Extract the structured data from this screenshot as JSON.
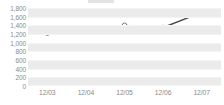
{
  "chart_data": {
    "type": "line",
    "title": "",
    "subtitle": "",
    "xlabel": "",
    "ylabel": "",
    "categories": [
      "12/03",
      "12/04",
      "12/05",
      "12/06",
      "12/07"
    ],
    "series": [
      {
        "name": "series-1",
        "values": [
          1220,
          1250,
          1400,
          1350,
          1700
        ]
      }
    ],
    "ylim": [
      0,
      1800
    ],
    "ytick_step": 200,
    "ytick_labels": [
      "1,800",
      "1,600",
      "1,400",
      "1,200",
      "1,000",
      "800",
      "600",
      "400",
      "200",
      "0"
    ],
    "ytick_values": [
      1800,
      1600,
      1400,
      1200,
      1000,
      800,
      600,
      400,
      200,
      0
    ],
    "xtick_labels": [
      "12/03",
      "12/04",
      "12/05",
      "12/06",
      "12/07"
    ],
    "grid": true,
    "grid_style": "alternating-horizontal-bands",
    "legend": false,
    "legend_position": "none",
    "marker": "circle-open",
    "colors": {
      "line": "#4d4d4d",
      "marker_fill": "#ffffff",
      "marker_stroke": "#7a7a7a",
      "band": "#ebebeb",
      "plot_background": "#ffffff",
      "tick_label": "#8a8a8a",
      "gridline": "#f4f4f4"
    }
  }
}
